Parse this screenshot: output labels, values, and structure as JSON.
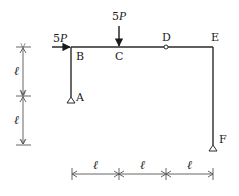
{
  "diagram": {
    "type": "structural-frame",
    "nodes": [
      {
        "id": "A",
        "label": "A",
        "x": 71,
        "y": 97,
        "support": "pin"
      },
      {
        "id": "B",
        "label": "B",
        "x": 71,
        "y": 47
      },
      {
        "id": "C",
        "label": "C",
        "x": 119,
        "y": 47
      },
      {
        "id": "D",
        "label": "D",
        "x": 166,
        "y": 47,
        "hinge": true
      },
      {
        "id": "E",
        "label": "E",
        "x": 213,
        "y": 47
      },
      {
        "id": "F",
        "label": "F",
        "x": 213,
        "y": 146,
        "support": "pin"
      }
    ],
    "members": [
      [
        "A",
        "B"
      ],
      [
        "B",
        "C"
      ],
      [
        "C",
        "D"
      ],
      [
        "D",
        "E"
      ],
      [
        "E",
        "F"
      ]
    ],
    "loads": [
      {
        "id": "horizontal",
        "label_coef": "5",
        "label_var": "P",
        "at": "B",
        "direction": "right"
      },
      {
        "id": "vertical",
        "label_coef": "5",
        "label_var": "P",
        "at": "C",
        "direction": "down"
      }
    ],
    "dimensions": {
      "vertical": [
        {
          "label": "ℓ",
          "from": "B-level",
          "to": "A-level"
        },
        {
          "label": "ℓ",
          "from": "A-level",
          "to": "F-level"
        }
      ],
      "horizontal": [
        {
          "label": "ℓ",
          "from": "B",
          "to": "C"
        },
        {
          "label": "ℓ",
          "from": "C",
          "to": "D"
        },
        {
          "label": "ℓ",
          "from": "D",
          "to": "E"
        }
      ]
    }
  },
  "labels": {
    "A": "A",
    "B": "B",
    "C": "C",
    "D": "D",
    "E": "E",
    "F": "F",
    "load_h_coef": "5",
    "load_h_var": "P",
    "load_v_coef": "5",
    "load_v_var": "P",
    "ell": "ℓ"
  },
  "colors": {
    "line": "#2a2a2a",
    "dim": "#555555",
    "background": "#ffffff"
  }
}
